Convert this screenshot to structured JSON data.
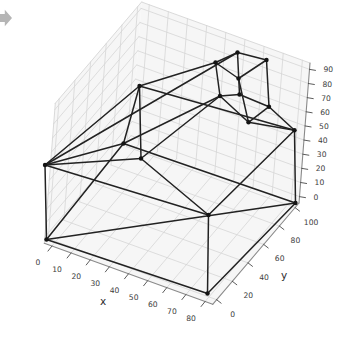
{
  "figure": {
    "width": 353,
    "height": 340,
    "background": "#ffffff"
  },
  "corner_icon": {
    "name": "gray-arrow-fragment",
    "color": "#b5b5b5"
  },
  "chart_data": {
    "type": "line3d",
    "title": "",
    "view": {
      "elev_deg": 30,
      "azim_deg": -60,
      "projection": "matplotlib-3d-approx"
    },
    "axes": {
      "x": {
        "label": "x",
        "ticks": [
          0,
          10,
          20,
          30,
          40,
          50,
          60,
          70,
          80
        ],
        "range": [
          -4,
          84
        ]
      },
      "y": {
        "label": "y",
        "ticks": [
          0,
          20,
          40,
          60,
          80,
          100
        ],
        "range": [
          -5,
          105
        ]
      },
      "z": {
        "label": "",
        "ticks": [
          0,
          10,
          20,
          30,
          40,
          50,
          60,
          70,
          80,
          90
        ],
        "range": [
          -4.5,
          94.5
        ]
      }
    },
    "nodes": [
      {
        "id": "A",
        "xyz_approx": [
          0,
          0,
          0
        ],
        "px": [
          46.5,
          239.5
        ]
      },
      {
        "id": "B",
        "xyz_approx": [
          80,
          0,
          0
        ],
        "px": [
          207.5,
          293.5
        ]
      },
      {
        "id": "C",
        "xyz_approx": [
          80,
          100,
          0
        ],
        "px": [
          295.5,
          203
        ]
      },
      {
        "id": "G",
        "xyz_approx": [
          0,
          100,
          0
        ],
        "px": [
          123.5,
          143.5
        ]
      },
      {
        "id": "D",
        "xyz_approx": [
          0,
          0,
          50
        ],
        "px": [
          45,
          165
        ]
      },
      {
        "id": "H",
        "xyz_approx": [
          80,
          0,
          50
        ],
        "px": [
          208.5,
          215
        ]
      },
      {
        "id": "E",
        "xyz_approx": [
          80,
          100,
          50
        ],
        "px": [
          294.5,
          130.3
        ]
      },
      {
        "id": "I",
        "xyz_approx": [
          30,
          65,
          80
        ],
        "px": [
          139.5,
          86
        ]
      },
      {
        "id": "F",
        "xyz_approx": [
          40,
          0,
          75
        ],
        "px": [
          141,
          158.5
        ]
      },
      {
        "id": "c1",
        "xyz_approx": [
          56,
          97,
          90
        ],
        "px": [
          237.5,
          52.5
        ]
      },
      {
        "id": "c2",
        "xyz_approx": [
          50,
          82,
          90
        ],
        "px": [
          215.5,
          62.5
        ]
      },
      {
        "id": "c3",
        "xyz_approx": [
          70,
          100,
          90
        ],
        "px": [
          266.5,
          60
        ]
      },
      {
        "id": "c4",
        "xyz_approx": [
          65,
          76,
          90
        ],
        "px": [
          238.5,
          78.5
        ]
      },
      {
        "id": "c5",
        "xyz_approx": [
          50,
          93,
          62
        ],
        "px": [
          220,
          96
        ]
      },
      {
        "id": "c6",
        "xyz_approx": [
          70,
          79,
          62
        ],
        "px": [
          248.5,
          122.3
        ]
      },
      {
        "id": "c7",
        "xyz_approx": [
          73,
          99,
          62
        ],
        "px": [
          269,
          106.7
        ]
      },
      {
        "id": "c8",
        "xyz_approx": [
          57,
          100,
          62
        ],
        "px": [
          239.5,
          94.5
        ]
      }
    ],
    "edges": [
      [
        "A",
        "B"
      ],
      [
        "B",
        "C"
      ],
      [
        "C",
        "G"
      ],
      [
        "G",
        "A"
      ],
      [
        "A",
        "C"
      ],
      [
        "A",
        "D"
      ],
      [
        "B",
        "H"
      ],
      [
        "C",
        "E"
      ],
      [
        "G",
        "I"
      ],
      [
        "D",
        "H"
      ],
      [
        "H",
        "E"
      ],
      [
        "I",
        "E"
      ],
      [
        "D",
        "G"
      ],
      [
        "D",
        "I"
      ],
      [
        "D",
        "F"
      ],
      [
        "H",
        "F"
      ],
      [
        "I",
        "F"
      ],
      [
        "I",
        "c2"
      ],
      [
        "D",
        "c1"
      ],
      [
        "F",
        "c5"
      ],
      [
        "G",
        "c5"
      ],
      [
        "c6",
        "E"
      ],
      [
        "c7",
        "E"
      ],
      [
        "c2",
        "c1"
      ],
      [
        "c1",
        "c3"
      ],
      [
        "c3",
        "c4"
      ],
      [
        "c4",
        "c2"
      ],
      [
        "c5",
        "c8"
      ],
      [
        "c8",
        "c7"
      ],
      [
        "c7",
        "c6"
      ],
      [
        "c6",
        "c5"
      ],
      [
        "c2",
        "c5"
      ],
      [
        "c1",
        "c8"
      ],
      [
        "c3",
        "c7"
      ],
      [
        "c4",
        "c6"
      ]
    ],
    "style": {
      "line_color": "#222222",
      "line_width": 1.5,
      "marker_color": "#141414",
      "marker_radius": 2.2,
      "grid_color": "#d6d6d6",
      "pane_color": "#f6f6f6",
      "spine_color": "#8a8a8a",
      "tick_color": "#4a4a4a",
      "tick_label_color": "#3c3c3c",
      "axis_label_color": "#2b2b2b"
    }
  }
}
